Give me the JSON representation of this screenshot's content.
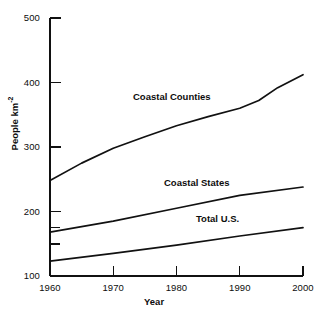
{
  "chart_data": {
    "type": "line",
    "title": "",
    "subtitle": "",
    "xlabel": "Year",
    "ylabel": "People km⁻²",
    "ylabel_base": "People km",
    "ylabel_exponent": "-2",
    "x": [
      1960,
      1970,
      1980,
      1990,
      2000
    ],
    "xlim": [
      1960,
      2000
    ],
    "ylim": [
      100,
      500
    ],
    "xticks": [
      1960,
      1970,
      1980,
      1990,
      2000
    ],
    "xtick_labels": [
      "1960",
      "1970",
      "1980",
      "1990",
      "2000"
    ],
    "yticks": [
      100,
      200,
      300,
      400,
      500
    ],
    "ytick_labels": [
      "100",
      "200",
      "300",
      "400",
      "500"
    ],
    "y_minor_ticks": [
      125,
      150
    ],
    "grid": false,
    "legend": "inline-labels",
    "legend_position": "inline",
    "line_color": "#111111",
    "axis_color": "#111111",
    "background": "#ffffff",
    "series": [
      {
        "name": "Coastal Counties",
        "label": "Coastal Counties",
        "x": [
          1960,
          1965,
          1970,
          1975,
          1980,
          1985,
          1990,
          1993,
          1996,
          2000
        ],
        "values": [
          248,
          275,
          298,
          316,
          333,
          347,
          360,
          372,
          392,
          412
        ]
      },
      {
        "name": "Coastal States",
        "label": "Coastal States",
        "x": [
          1960,
          1970,
          1980,
          1990,
          2000
        ],
        "values": [
          168,
          185,
          205,
          225,
          238
        ]
      },
      {
        "name": "Total U.S.",
        "label": "Total U.S.",
        "x": [
          1960,
          1970,
          1980,
          1990,
          2000
        ],
        "values": [
          123,
          135,
          148,
          162,
          175
        ]
      }
    ],
    "annotations": [
      {
        "text": "Coastal Counties",
        "x": 1973,
        "y": 372
      },
      {
        "text": "Coastal States",
        "x": 1978,
        "y": 240
      },
      {
        "text": "Total U.S.",
        "x": 1983,
        "y": 184
      }
    ]
  }
}
